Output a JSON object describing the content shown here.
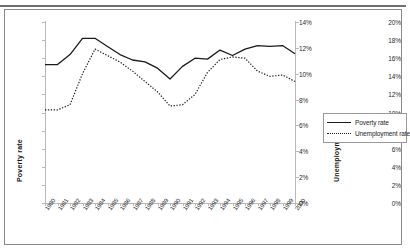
{
  "page": {
    "top_cropped_text": "",
    "background": "#ffffff"
  },
  "legend": {
    "position": "right",
    "items": [
      {
        "label": "Poverty rate",
        "style": "solid",
        "color": "#1a1a1a"
      },
      {
        "label": "Unemployment rate",
        "style": "dotted",
        "color": "#1a1a1a"
      }
    ]
  },
  "axes": {
    "left_title": "Poverty rate",
    "right_title": "Unemployment rate",
    "left_ticks": [
      "0%",
      "2%",
      "4%",
      "6%",
      "8%",
      "10%",
      "12%",
      "14%",
      "16%",
      "18%",
      "20%"
    ],
    "right_ticks": [
      "0%",
      "2%",
      "4%",
      "6%",
      "8%",
      "10%",
      "12%",
      "14%"
    ]
  },
  "chart_data": {
    "type": "line",
    "title": "",
    "subtitle": "",
    "xlabel": "",
    "ylabel": "Poverty rate",
    "y2label": "Unemployment rate",
    "grid": false,
    "legend_position": "right",
    "ylim": [
      0,
      20
    ],
    "y2lim": [
      0,
      14
    ],
    "ytick_step": 2,
    "y2tick_step": 2,
    "categories": [
      "1980",
      "1981",
      "1982",
      "1983",
      "1984",
      "1985",
      "1986",
      "1987",
      "1988",
      "1989",
      "1990",
      "1991",
      "1992",
      "1993",
      "1994",
      "1995",
      "1996",
      "1997",
      "1998",
      "1999",
      "2000"
    ],
    "series": [
      {
        "name": "Poverty rate",
        "axis": "left",
        "style": "solid",
        "color": "#1a1a1a",
        "units": "percent",
        "values": [
          15.3,
          15.3,
          16.4,
          18.2,
          18.2,
          17.3,
          16.4,
          15.8,
          15.6,
          14.9,
          13.7,
          15.1,
          16.0,
          15.9,
          16.9,
          16.3,
          17.0,
          17.4,
          17.3,
          17.4,
          16.5
        ]
      },
      {
        "name": "Unemployment rate",
        "axis": "right",
        "style": "dotted",
        "color": "#1a1a1a",
        "units": "percent",
        "values": [
          7.2,
          7.2,
          7.6,
          10.0,
          11.9,
          11.4,
          10.9,
          10.2,
          9.4,
          8.6,
          7.5,
          7.6,
          8.4,
          10.1,
          11.1,
          11.3,
          11.2,
          10.2,
          9.8,
          9.9,
          9.4
        ]
      }
    ],
    "annotations": []
  }
}
